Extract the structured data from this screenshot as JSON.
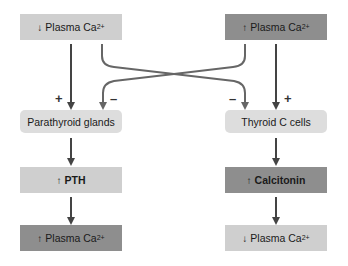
{
  "colors": {
    "light_box": "#cfcfcf",
    "dark_box": "#8e8e8e",
    "gland_box": "#dddddd",
    "arrow": "#444444",
    "inhibit_arrow": "#666666"
  },
  "left": {
    "stimulus": {
      "direction": "↓",
      "label": "Plasma Ca",
      "superscript": "2+"
    },
    "organ": "Parathyroid glands",
    "hormone": {
      "direction": "↑",
      "label": "PTH"
    },
    "result": {
      "direction": "↑",
      "label": "Plasma Ca",
      "superscript": "2+"
    },
    "stim_sign": "+",
    "inhibit_sign": "–"
  },
  "right": {
    "stimulus": {
      "direction": "↑",
      "label": "Plasma Ca",
      "superscript": "2+"
    },
    "organ": "Thyroid C cells",
    "hormone": {
      "direction": "↑",
      "label": "Calcitonin"
    },
    "result": {
      "direction": "↓",
      "label": "Plasma Ca",
      "superscript": "2+"
    },
    "stim_sign": "+",
    "inhibit_sign": "–"
  }
}
